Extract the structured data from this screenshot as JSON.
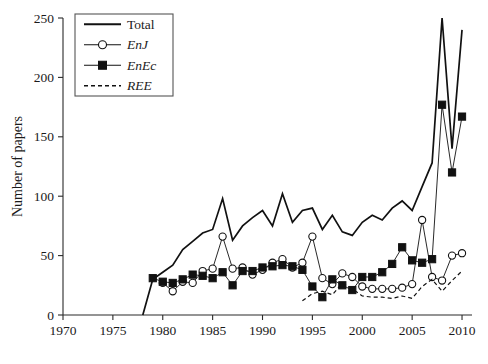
{
  "chart_data": {
    "type": "line",
    "title": "",
    "xlabel": "",
    "ylabel": "Number of papers",
    "xlim": [
      1970,
      2011
    ],
    "ylim": [
      0,
      250
    ],
    "xticks": [
      1970,
      1975,
      1980,
      1985,
      1990,
      1995,
      2000,
      2005,
      2010
    ],
    "yticks": [
      0,
      50,
      100,
      150,
      200,
      250
    ],
    "grid": false,
    "legend_position": "top-left",
    "series": [
      {
        "name": "Total",
        "style": "solid-line",
        "marker": "none",
        "color": "#111111",
        "x": [
          1978,
          1979,
          1980,
          1981,
          1982,
          1983,
          1984,
          1985,
          1986,
          1987,
          1988,
          1989,
          1990,
          1991,
          1992,
          1993,
          1994,
          1995,
          1996,
          1997,
          1998,
          1999,
          2000,
          2001,
          2002,
          2003,
          2004,
          2005,
          2006,
          2007,
          2008,
          2009,
          2010
        ],
        "values": [
          0,
          30,
          36,
          42,
          55,
          62,
          69,
          72,
          98,
          63,
          75,
          82,
          88,
          75,
          102,
          78,
          88,
          90,
          72,
          84,
          70,
          67,
          78,
          84,
          80,
          90,
          96,
          88,
          108,
          128,
          250,
          140,
          240
        ]
      },
      {
        "name": "EnJ",
        "style": "solid-line",
        "marker": "open-circle",
        "color": "#111111",
        "x": [
          1980,
          1981,
          1982,
          1983,
          1984,
          1985,
          1986,
          1987,
          1988,
          1989,
          1990,
          1991,
          1992,
          1993,
          1994,
          1995,
          1996,
          1997,
          1998,
          1999,
          2000,
          2001,
          2002,
          2003,
          2004,
          2005,
          2006,
          2007,
          2008,
          2009,
          2010
        ],
        "values": [
          27,
          20,
          28,
          27,
          37,
          39,
          66,
          39,
          40,
          34,
          38,
          44,
          47,
          40,
          44,
          66,
          31,
          26,
          35,
          32,
          24,
          22,
          22,
          22,
          23,
          26,
          80,
          32,
          29,
          50,
          52
        ]
      },
      {
        "name": "EnEc",
        "style": "solid-line",
        "marker": "filled-square",
        "color": "#111111",
        "x": [
          1979,
          1980,
          1981,
          1982,
          1983,
          1984,
          1985,
          1986,
          1987,
          1988,
          1989,
          1990,
          1991,
          1992,
          1993,
          1994,
          1995,
          1996,
          1997,
          1998,
          1999,
          2000,
          2001,
          2002,
          2003,
          2004,
          2005,
          2006,
          2007,
          2008,
          2009,
          2010
        ],
        "values": [
          31,
          28,
          27,
          30,
          34,
          33,
          31,
          36,
          25,
          37,
          37,
          40,
          41,
          42,
          41,
          38,
          24,
          15,
          30,
          25,
          21,
          32,
          32,
          36,
          43,
          57,
          46,
          44,
          47,
          177,
          120,
          167
        ]
      },
      {
        "name": "REE",
        "style": "dashed-line",
        "marker": "none",
        "color": "#111111",
        "x": [
          1994,
          1995,
          1996,
          1997,
          1998,
          1999,
          2000,
          2001,
          2002,
          2003,
          2004,
          2005,
          2006,
          2007,
          2008,
          2009,
          2010
        ],
        "values": [
          12,
          18,
          20,
          17,
          27,
          22,
          16,
          15,
          15,
          14,
          16,
          14,
          24,
          30,
          20,
          29,
          37
        ]
      }
    ],
    "legend": [
      {
        "label": "Total",
        "style": "solid-line",
        "marker": "none",
        "italic": false
      },
      {
        "label": "EnJ",
        "style": "solid-line",
        "marker": "open-circle",
        "italic": true
      },
      {
        "label": "EnEc",
        "style": "solid-line",
        "marker": "filled-square",
        "italic": true
      },
      {
        "label": "REE",
        "style": "dashed-line",
        "marker": "none",
        "italic": true
      }
    ]
  }
}
